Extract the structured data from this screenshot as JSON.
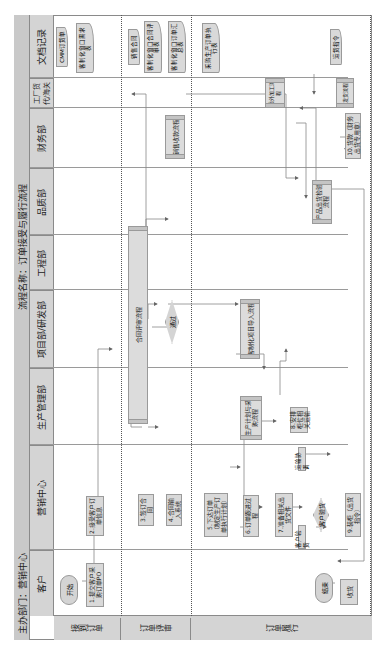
{
  "header": {
    "dept_label": "主办部门：营销中心",
    "process_name": "流程名称：订单接受与履行流程"
  },
  "lanes": [
    {
      "id": "customer",
      "label": "客户"
    },
    {
      "id": "sales",
      "label": "营销中心"
    },
    {
      "id": "production",
      "label": "生产管理部"
    },
    {
      "id": "project",
      "label": "项目部/研发部"
    },
    {
      "id": "engineering",
      "label": "工程部"
    },
    {
      "id": "quality",
      "label": "品质部"
    },
    {
      "id": "finance",
      "label": "财务部"
    },
    {
      "id": "factory",
      "label": "工厂货代/海关"
    },
    {
      "id": "docs",
      "label": "文档记录"
    }
  ],
  "phases": [
    {
      "label": "接到订单"
    },
    {
      "label": "订单评审"
    },
    {
      "label": "订单履行"
    }
  ],
  "nodes": {
    "start": "开始",
    "end": "结束",
    "step1": "1.提交客户采购订单PO",
    "step2": "2.接受客户订单信息",
    "step3": "3.签订合同",
    "step4": "4.合同输入系统",
    "step5": "5.下达订单（制定生产订单执行计划）",
    "step6": "6.订单跟进过程",
    "step7": "7.准备相关出货文件",
    "step8": "8.安排柜位相关运输",
    "step9": "9.装柜（出货指令）",
    "step10": "10.货款（财务出货专用章）",
    "contract_review": "合同评审流程",
    "pass_decision": "通过",
    "customer_decision": "客户验货",
    "custom_project": "客制化项目导入流程",
    "production_plan": "生产计划与采购流程",
    "outsource": "委外加工流程",
    "shipping": "发货流程",
    "qc_inspection": "产品出货检验流程",
    "payment": "销售收款流程",
    "receive": "收货",
    "note_customer_inspect": "客户验货",
    "note_transport": "运输协调"
  },
  "documents": {
    "cmm_order": "CMM订货单",
    "custom_req": "客制化窗口需求表",
    "sales_contract": "销售合同",
    "custom_review": "客制化窗口合同评审表",
    "custom_window_order": "客制化窗口订单汇总表",
    "production_order": "采购生产订单执行表",
    "shipping_notice": "运货指令"
  },
  "colors": {
    "box_fill": "#d9d9d9",
    "header_fill": "#c9c9c9",
    "line": "#8a8a8a"
  }
}
